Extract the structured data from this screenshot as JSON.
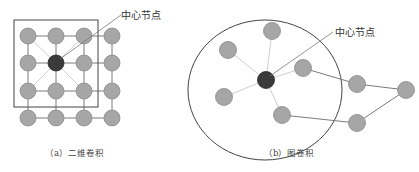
{
  "panels": {
    "a": {
      "caption": "（a）二维卷积",
      "center_label": "中心节点"
    },
    "b": {
      "caption": "（b）图卷积",
      "center_label": "中心节点"
    }
  },
  "colors": {
    "node_fill": "#a6a6a6",
    "node_stroke": "#8a8a8a",
    "center_fill": "#3a3a3a",
    "edge": "#7a7a7a",
    "light_edge": "#d0d0d0",
    "frame": "#444444"
  }
}
